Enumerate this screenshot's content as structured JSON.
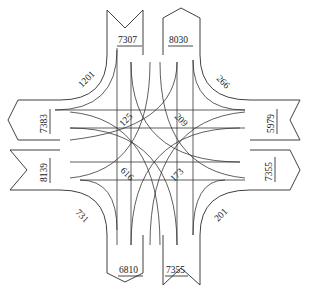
{
  "diagram": {
    "type": "intersection-turning-movement-flow",
    "approaches": {
      "north": {
        "inbound": "7307",
        "outbound": "8030"
      },
      "east": {
        "inbound": "5979",
        "outbound": "7355"
      },
      "south": {
        "inbound": "7355",
        "outbound": "6810"
      },
      "west": {
        "inbound": "8139",
        "outbound": "7383"
      }
    },
    "right_turns": {
      "northwest": "1201",
      "northeast": "266",
      "southwest": "731",
      "southeast": "201"
    },
    "left_turns_center": {
      "top_left": "125",
      "top_right": "209",
      "bottom_left": "616",
      "bottom_right": "173"
    }
  }
}
